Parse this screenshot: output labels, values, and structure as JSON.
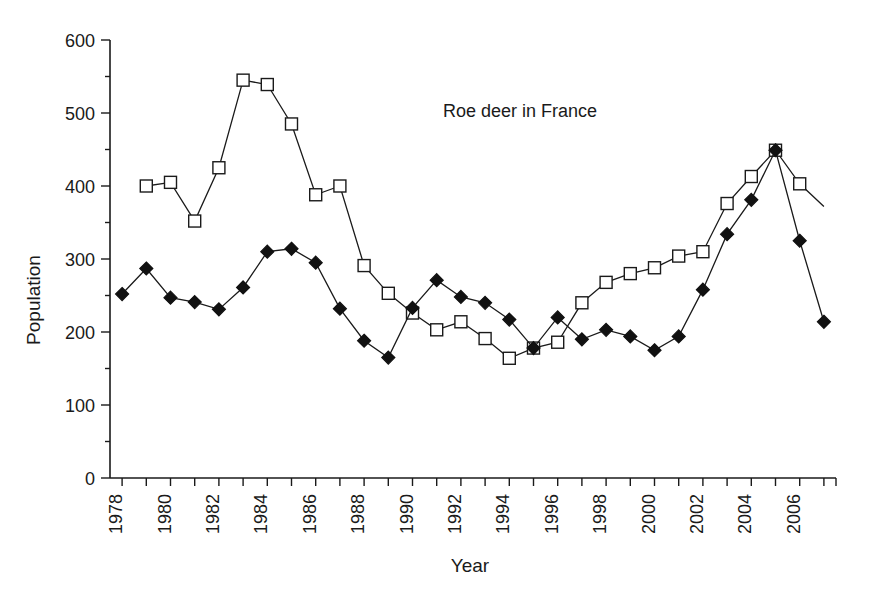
{
  "chart_data": {
    "type": "line",
    "title": "Roe deer in France",
    "title_position": "inside-upper-center",
    "xlabel": "Year",
    "ylabel": "Population",
    "xlim": [
      1977.5,
      2007.5
    ],
    "ylim": [
      0,
      600
    ],
    "ytick_interval": 100,
    "yminor_tick_interval": 50,
    "xtick_interval": 1,
    "xticklabel_interval": 2,
    "xticklabel_rotation": 90,
    "grid": false,
    "legend": "none",
    "yticks": [
      0,
      100,
      200,
      300,
      400,
      500,
      600
    ],
    "yticklabels": [
      "0",
      "100",
      "200",
      "300",
      "400",
      "500",
      "600"
    ],
    "xticks": [
      1978,
      1979,
      1980,
      1981,
      1982,
      1983,
      1984,
      1985,
      1986,
      1987,
      1988,
      1989,
      1990,
      1991,
      1992,
      1993,
      1994,
      1995,
      1996,
      1997,
      1998,
      1999,
      2000,
      2001,
      2002,
      2003,
      2004,
      2005,
      2006,
      2007
    ],
    "xticklabels": [
      "1978",
      "1980",
      "1982",
      "1984",
      "1986",
      "1988",
      "1990",
      "1992",
      "1994",
      "1996",
      "1998",
      "2000",
      "2002",
      "2004",
      "2006"
    ],
    "xticklabel_years": [
      1978,
      1980,
      1982,
      1984,
      1986,
      1988,
      1990,
      1992,
      1994,
      1996,
      1998,
      2000,
      2002,
      2004,
      2006
    ],
    "series": [
      {
        "name": "open-square-series",
        "marker": "open-square",
        "x": [
          1979,
          1980,
          1981,
          1982,
          1983,
          1984,
          1985,
          1986,
          1987,
          1988,
          1989,
          1990,
          1991,
          1992,
          1993,
          1994,
          1995,
          1996,
          1997,
          1998,
          1999,
          2000,
          2001,
          2002,
          2003,
          2004,
          2005,
          2006
        ],
        "values": [
          400,
          405,
          352,
          425,
          545,
          539,
          485,
          388,
          400,
          291,
          253,
          226,
          203,
          214,
          191,
          164,
          178,
          186,
          240,
          268,
          280,
          288,
          304,
          310,
          376,
          413,
          449,
          403
        ],
        "trailing_segment_to": [
          2007,
          372
        ]
      },
      {
        "name": "filled-diamond-series",
        "marker": "filled-diamond",
        "x": [
          1978,
          1979,
          1980,
          1981,
          1982,
          1983,
          1984,
          1985,
          1986,
          1987,
          1988,
          1989,
          1990,
          1991,
          1992,
          1993,
          1994,
          1995,
          1996,
          1997,
          1998,
          1999,
          2000,
          2001,
          2002,
          2003,
          2004,
          2005,
          2006,
          2007
        ],
        "values": [
          252,
          287,
          247,
          241,
          231,
          261,
          310,
          314,
          295,
          232,
          188,
          165,
          233,
          271,
          248,
          240,
          217,
          178,
          220,
          190,
          203,
          194,
          175,
          194,
          258,
          334,
          381,
          449,
          325,
          214
        ]
      }
    ]
  },
  "colors": {
    "ink": "#1a1a1a",
    "background": "#ffffff",
    "marker_fill_open": "#ffffff",
    "marker_fill_solid": "#111111"
  }
}
